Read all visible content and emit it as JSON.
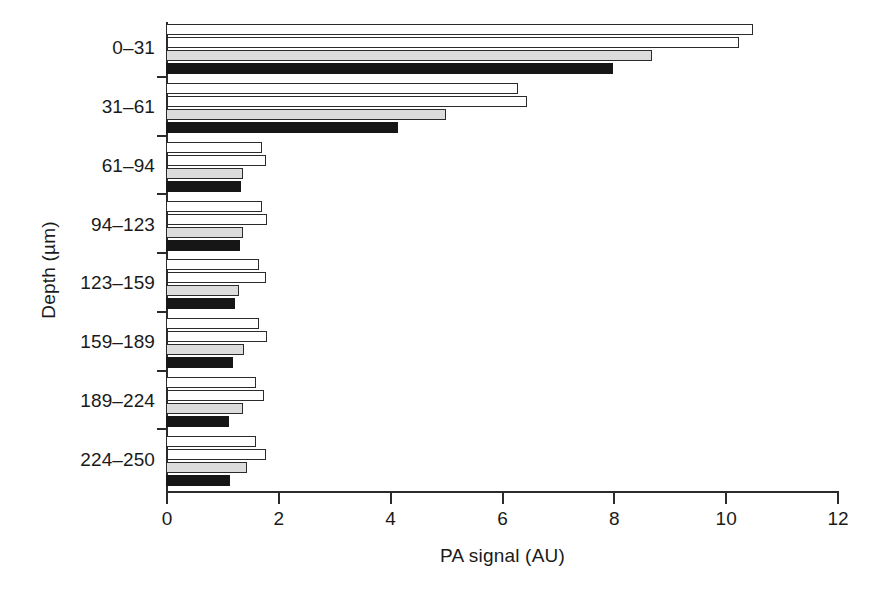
{
  "chart_data": {
    "type": "bar",
    "orientation": "horizontal",
    "title": "",
    "xlabel": "PA signal (AU)",
    "ylabel": "Depth (µm)",
    "xlim": [
      0,
      12
    ],
    "xticks": [
      0,
      2,
      4,
      6,
      8,
      10,
      12
    ],
    "xtick_labels": [
      "0",
      "2",
      "4",
      "6",
      "8",
      "10",
      "12"
    ],
    "grid": false,
    "legend": "none",
    "categories": [
      "0–31",
      "31–61",
      "61–94",
      "94–123",
      "123–159",
      "159–189",
      "189–224",
      "224–250"
    ],
    "series": [
      {
        "name": "series-1",
        "style": "white",
        "values": [
          10.5,
          6.3,
          1.72,
          1.72,
          1.67,
          1.67,
          1.61,
          1.61
        ]
      },
      {
        "name": "series-2",
        "style": "hatched",
        "values": [
          10.25,
          6.45,
          1.79,
          1.81,
          1.79,
          1.81,
          1.76,
          1.79
        ]
      },
      {
        "name": "series-3",
        "style": "gray",
        "values": [
          8.7,
          5.0,
          1.38,
          1.38,
          1.31,
          1.4,
          1.38,
          1.45
        ]
      },
      {
        "name": "series-4",
        "style": "black",
        "values": [
          8.0,
          4.15,
          1.34,
          1.32,
          1.24,
          1.2,
          1.13,
          1.14
        ]
      }
    ]
  },
  "axes": {
    "x_title": "PA signal (AU)",
    "y_title": "Depth (µm)"
  },
  "colors": {
    "axis": "#2b2b2b",
    "bar_white": "#ffffff",
    "bar_gray": "#dcdcdc",
    "bar_black": "#161616",
    "background": "#ffffff"
  }
}
